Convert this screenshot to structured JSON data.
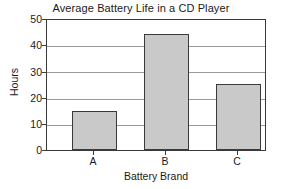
{
  "chart_data": {
    "type": "bar",
    "title": "Average Battery Life in a CD Player",
    "xlabel": "Battery Brand",
    "ylabel": "Hours",
    "categories": [
      "A",
      "B",
      "C"
    ],
    "values": [
      15,
      44.5,
      25.5
    ],
    "ylim": [
      0,
      50
    ],
    "yticks": [
      0,
      10,
      20,
      30,
      40,
      50
    ],
    "ytick_labels": [
      "0",
      "10",
      "20",
      "30",
      "40",
      "50"
    ],
    "grid": true,
    "grid_axis": "y",
    "legend": false,
    "bar_fill_color": "#c9c9c9",
    "bar_edge_color": "#3a3a3a",
    "gridline_color": "#9b9b9b",
    "background_color": "#ffffff"
  }
}
